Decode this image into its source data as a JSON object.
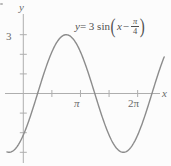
{
  "figure": {
    "background": "#fcfcfc",
    "axis_color": "#aeaeae",
    "curve_color": "#8c8c8c",
    "tick_label_color": "#6b6b6b",
    "equation_color": "#4f4f4f",
    "corner_mark": "."
  },
  "labels": {
    "y_axis": "y",
    "x_axis": "x",
    "y_tick_3": "3",
    "x_tick_pi": "π",
    "x_tick_2pi": "2π"
  },
  "equation": {
    "y_var": "y",
    "equals_coeff_func": " = 3 sin",
    "open_paren": "(",
    "x_var": "x",
    "minus": " − ",
    "frac_numerator": "π",
    "frac_denominator": "4",
    "close_paren": ")"
  },
  "chart_data": {
    "type": "line",
    "expression": "y = 3*sin(x - pi/4)",
    "amplitude": 3,
    "phase_shift_rad": 0.7853981634,
    "x_range": [
      -0.9,
      7.75
    ],
    "y_range": [
      -3,
      3
    ],
    "x_tick_values": [
      1.5707963,
      3.1415927,
      4.712389,
      6.2831853
    ],
    "x_tick_labels": [
      "",
      "π",
      "",
      "2π"
    ],
    "y_tick_values": [
      -3,
      -2,
      -1,
      1,
      2,
      3
    ],
    "y_tick_labels": [
      "",
      "",
      "",
      "",
      "",
      "3"
    ],
    "key_points": {
      "x_intercepts": [
        0.7853982,
        3.9269908,
        7.0685835
      ],
      "maximum": {
        "x": 2.3561945,
        "y": 3
      },
      "minimum": {
        "x": 5.4977871,
        "y": -3
      }
    },
    "grid": false,
    "legend": false
  }
}
